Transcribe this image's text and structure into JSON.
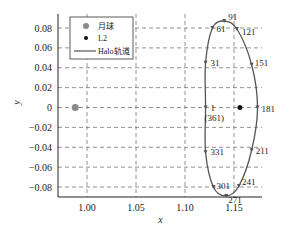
{
  "chart_data": {
    "type": "scatter",
    "title": "",
    "xlabel": "x",
    "ylabel": "y",
    "xlim": [
      0.97,
      1.175
    ],
    "ylim": [
      -0.09,
      0.09
    ],
    "grid": true,
    "legend_position": "upper left",
    "x_ticks": [
      "1.00",
      "1.05",
      "1.10",
      "1.15"
    ],
    "y_ticks": [
      "0.08",
      "0.06",
      "0.04",
      "0.02",
      "0",
      "-0.02",
      "-0.04",
      "-0.06",
      "-0.08"
    ],
    "legend": [
      "月球",
      "L2",
      "Halo轨道"
    ],
    "series": [
      {
        "name": "月球",
        "type": "point",
        "x": [
          0.988
        ],
        "y": [
          0.0
        ],
        "color": "#8a8a8a"
      },
      {
        "name": "L2",
        "type": "point",
        "x": [
          1.156
        ],
        "y": [
          0.0
        ],
        "color": "#111111"
      },
      {
        "name": "Halo轨道",
        "type": "line",
        "color": "#555555",
        "points": [
          {
            "label": "1\n(361)",
            "x": 1.121,
            "y": 0.0
          },
          {
            "label": "31",
            "x": 1.121,
            "y": 0.045
          },
          {
            "label": "61",
            "x": 1.128,
            "y": 0.08
          },
          {
            "label": "91",
            "x": 1.14,
            "y": 0.087
          },
          {
            "label": "121",
            "x": 1.153,
            "y": 0.079
          },
          {
            "label": "151",
            "x": 1.168,
            "y": 0.043
          },
          {
            "label": "181",
            "x": 1.174,
            "y": 0.0
          },
          {
            "label": "211",
            "x": 1.168,
            "y": -0.043
          },
          {
            "label": "241",
            "x": 1.155,
            "y": -0.079
          },
          {
            "label": "271",
            "x": 1.142,
            "y": -0.089
          },
          {
            "label": "301",
            "x": 1.129,
            "y": -0.08
          },
          {
            "label": "331",
            "x": 1.121,
            "y": -0.045
          }
        ]
      }
    ]
  }
}
